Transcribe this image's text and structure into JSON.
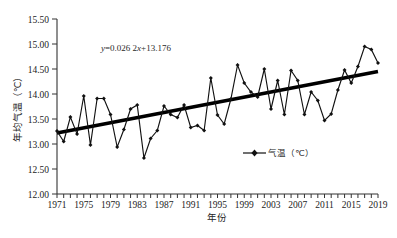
{
  "figure": {
    "name": "annual-mean-temperature-trend-chart",
    "equation": {
      "lead": "y",
      "body": "=0.026 2",
      "x_sym": "x",
      "tail": "+13.176",
      "full": "y=0.026 2x+13.176"
    },
    "caption_fragment": ""
  },
  "axes": {
    "y_title": "年均气温（℃）",
    "x_title": "年份",
    "y_ticks": [
      "12.00",
      "12.50",
      "13.00",
      "13.50",
      "14.00",
      "14.50",
      "15.00",
      "15.50"
    ],
    "x_ticks": [
      "1971",
      "1975",
      "1979",
      "1983",
      "1987",
      "1991",
      "1995",
      "1999",
      "2003",
      "2007",
      "2011",
      "2015",
      "2019"
    ]
  },
  "legend": {
    "entries": [
      {
        "label": "气温（℃）",
        "marker": "diamond-line-marker",
        "color": "#111111"
      }
    ]
  },
  "colors": {
    "series": "#111111",
    "trend": "#000000",
    "axis": "#333333",
    "background": "#ffffff"
  },
  "chart_data": {
    "type": "line",
    "title": "",
    "subtitle": "",
    "xlabel": "年份",
    "ylabel": "年均气温（℃）",
    "xlim": [
      1971,
      2019
    ],
    "ylim": [
      12.0,
      15.5
    ],
    "ytick_step": 0.5,
    "xtick_step": 4,
    "grid": false,
    "legend_position": "inside-bottom-right",
    "annotations": [
      {
        "text": "y=0.026 2x+13.176",
        "x": 1984,
        "y": 15.05,
        "type": "trend-equation"
      }
    ],
    "trendline": {
      "type": "linear",
      "slope": 0.0262,
      "intercept": 13.176,
      "y_start": 13.22,
      "y_end": 14.45,
      "x_start": 1971,
      "x_end": 2019
    },
    "x": [
      1971,
      1972,
      1973,
      1974,
      1975,
      1976,
      1977,
      1978,
      1979,
      1980,
      1981,
      1982,
      1983,
      1984,
      1985,
      1986,
      1987,
      1988,
      1989,
      1990,
      1991,
      1992,
      1993,
      1994,
      1995,
      1996,
      1997,
      1998,
      1999,
      2000,
      2001,
      2002,
      2003,
      2004,
      2005,
      2006,
      2007,
      2008,
      2009,
      2010,
      2011,
      2012,
      2013,
      2014,
      2015,
      2016,
      2017,
      2018,
      2019
    ],
    "series": [
      {
        "name": "气温（℃）",
        "values": [
          13.26,
          13.05,
          13.54,
          13.2,
          13.96,
          12.98,
          13.91,
          13.91,
          13.59,
          12.94,
          13.29,
          13.7,
          13.78,
          12.72,
          13.11,
          13.27,
          13.76,
          13.59,
          13.53,
          13.78,
          13.33,
          13.37,
          13.27,
          14.32,
          13.58,
          13.4,
          13.9,
          14.58,
          14.22,
          14.04,
          13.94,
          14.5,
          13.7,
          14.27,
          13.59,
          14.47,
          14.27,
          13.59,
          14.04,
          13.87,
          13.47,
          13.6,
          14.08,
          14.48,
          14.22,
          14.55,
          14.95,
          14.89,
          14.62
        ]
      }
    ]
  }
}
